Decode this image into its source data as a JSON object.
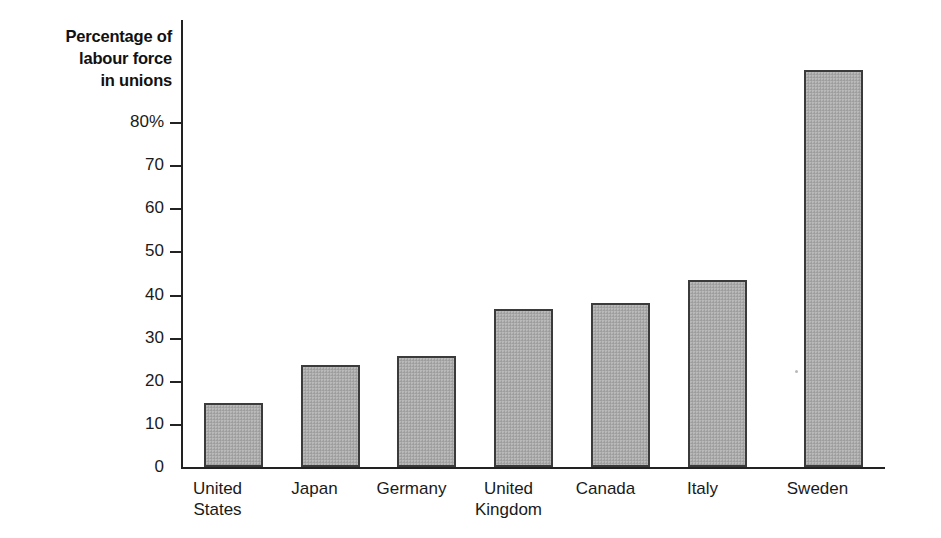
{
  "chart_data": {
    "type": "bar",
    "title": "Percentage of labour force in unions",
    "title_lines": [
      "Percentage of",
      "labour force",
      "in unions"
    ],
    "xlabel": "",
    "ylabel": "Percentage of labour force in unions",
    "ylim": [
      0,
      80
    ],
    "grid": false,
    "legend": null,
    "ytick_labels": [
      "80%",
      "70",
      "60",
      "50",
      "40",
      "30",
      "20",
      "10",
      "0"
    ],
    "ytick_values": [
      80,
      70,
      60,
      50,
      40,
      30,
      20,
      10,
      0
    ],
    "categories": [
      "United States",
      "Japan",
      "Germany",
      "United Kingdom",
      "Canada",
      "Italy",
      "Sweden"
    ],
    "category_lines": [
      [
        "United",
        "States"
      ],
      [
        "Japan"
      ],
      [
        "Germany"
      ],
      [
        "United",
        "Kingdom"
      ],
      [
        "Canada"
      ],
      [
        "Italy"
      ],
      [
        "Sweden"
      ]
    ],
    "values": [
      11.4,
      18.3,
      19.9,
      28.3,
      29.4,
      33.4,
      71.0
    ],
    "bar_fill_color": "#a9a9a9",
    "bar_border_color": "#3b3b3b",
    "axis_color": "#222222",
    "background_color": "#ffffff"
  }
}
